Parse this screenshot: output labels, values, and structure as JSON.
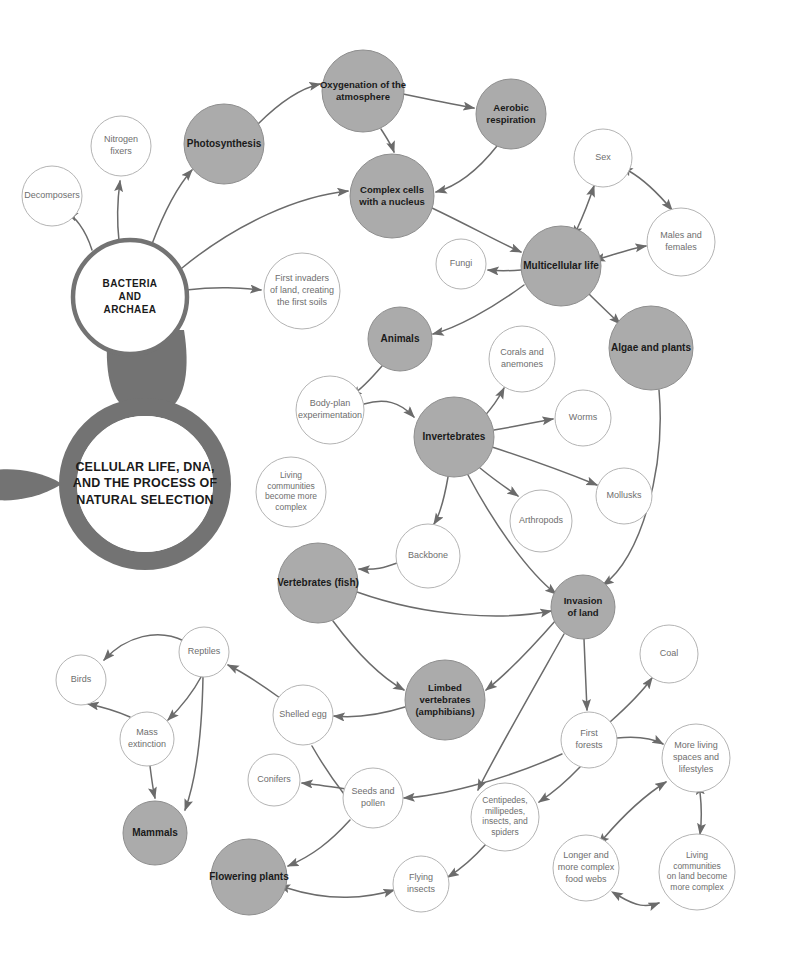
{
  "diagram": {
    "title_lines": [
      "CELLULAR LIFE, DNA,",
      "AND THE PROCESS OF",
      "NATURAL SELECTION"
    ],
    "root_label": "BACTERIA AND ARCHAEA",
    "root_lines": [
      "BACTERIA",
      "AND",
      "ARCHAEA"
    ],
    "colors": {
      "major_fill": "#ababab",
      "major_stroke": "#8e8e8e",
      "minor_fill": "#ffffff",
      "minor_stroke": "#b4b4b4",
      "arrow": "#6b6b6b",
      "magnifier": "#737373",
      "major_text": "#1a1a1a",
      "minor_text": "#6e6e6e",
      "background": "#ffffff"
    },
    "nodes": [
      {
        "id": "decomposers",
        "label": "Decomposers",
        "lines": [
          "Decomposers"
        ],
        "x": 52,
        "y": 196,
        "r": 30,
        "type": "minor",
        "fs": 9
      },
      {
        "id": "nitrogen-fixers",
        "label": "Nitrogen fixers",
        "lines": [
          "Nitrogen",
          "fixers"
        ],
        "x": 121,
        "y": 146,
        "r": 30,
        "type": "minor",
        "fs": 9
      },
      {
        "id": "photosynthesis",
        "label": "Photosynthesis",
        "lines": [
          "Photosynthesis"
        ],
        "x": 224,
        "y": 144,
        "r": 40,
        "type": "major",
        "fs": 10
      },
      {
        "id": "oxygenation",
        "label": "Oxygenation of the atmosphere",
        "lines": [
          "Oxygenation of the",
          "atmosphere"
        ],
        "x": 363,
        "y": 91,
        "r": 41,
        "type": "major",
        "fs": 9.5
      },
      {
        "id": "aerobic",
        "label": "Aerobic respiration",
        "lines": [
          "Aerobic",
          "respiration"
        ],
        "x": 511,
        "y": 114,
        "r": 35,
        "type": "major",
        "fs": 9.5
      },
      {
        "id": "complex-cells",
        "label": "Complex cells with a nucleus",
        "lines": [
          "Complex cells",
          "with a nucleus"
        ],
        "x": 392,
        "y": 196,
        "r": 42,
        "type": "major",
        "fs": 9.5
      },
      {
        "id": "sex",
        "label": "Sex",
        "lines": [
          "Sex"
        ],
        "x": 603,
        "y": 158,
        "r": 29,
        "type": "minor",
        "fs": 9
      },
      {
        "id": "males-females",
        "label": "Males and females",
        "lines": [
          "Males and",
          "females"
        ],
        "x": 681,
        "y": 242,
        "r": 34,
        "type": "minor",
        "fs": 9
      },
      {
        "id": "bacteria-archaea",
        "label": "BACTERIA AND ARCHAEA",
        "lines": [
          "BACTERIA",
          "AND",
          "ARCHAEA"
        ],
        "x": 130,
        "y": 297,
        "r": 57,
        "type": "root",
        "fs": 10
      },
      {
        "id": "first-invaders",
        "label": "First invaders of land, creating the first soils",
        "lines": [
          "First invaders",
          "of land, creating",
          "the first soils"
        ],
        "x": 302,
        "y": 291,
        "r": 38,
        "type": "minor",
        "fs": 9
      },
      {
        "id": "fungi",
        "label": "Fungi",
        "lines": [
          "Fungi"
        ],
        "x": 461,
        "y": 264,
        "r": 25,
        "type": "minor",
        "fs": 9
      },
      {
        "id": "multicellular",
        "label": "Multicellular life",
        "lines": [
          "Multicellular life"
        ],
        "x": 561,
        "y": 266,
        "r": 40,
        "type": "major",
        "fs": 10
      },
      {
        "id": "algae-plants",
        "label": "Algae and plants",
        "lines": [
          "Algae and plants"
        ],
        "x": 651,
        "y": 348,
        "r": 42,
        "type": "major",
        "fs": 10
      },
      {
        "id": "animals",
        "label": "Animals",
        "lines": [
          "Animals"
        ],
        "x": 400,
        "y": 339,
        "r": 32,
        "type": "major",
        "fs": 10
      },
      {
        "id": "corals-anemones",
        "label": "Corals and anemones",
        "lines": [
          "Corals and",
          "anemones"
        ],
        "x": 522,
        "y": 359,
        "r": 33,
        "type": "minor",
        "fs": 9
      },
      {
        "id": "body-plan",
        "label": "Body-plan experimentation",
        "lines": [
          "Body-plan",
          "experimentation"
        ],
        "x": 330,
        "y": 410,
        "r": 34,
        "type": "minor",
        "fs": 9
      },
      {
        "id": "invertebrates",
        "label": "Invertebrates",
        "lines": [
          "Invertebrates"
        ],
        "x": 454,
        "y": 437,
        "r": 40,
        "type": "major",
        "fs": 10
      },
      {
        "id": "worms",
        "label": "Worms",
        "lines": [
          "Worms"
        ],
        "x": 583,
        "y": 418,
        "r": 28,
        "type": "minor",
        "fs": 9
      },
      {
        "id": "mollusks",
        "label": "Mollusks",
        "lines": [
          "Mollusks"
        ],
        "x": 624,
        "y": 496,
        "r": 28,
        "type": "minor",
        "fs": 9
      },
      {
        "id": "arthropods",
        "label": "Arthropods",
        "lines": [
          "Arthropods"
        ],
        "x": 541,
        "y": 521,
        "r": 31,
        "type": "minor",
        "fs": 9
      },
      {
        "id": "living-complex",
        "label": "Living communities become more complex",
        "lines": [
          "Living",
          "communities",
          "become more",
          "complex"
        ],
        "x": 291,
        "y": 492,
        "r": 35,
        "type": "minor",
        "fs": 8.5
      },
      {
        "id": "backbone",
        "label": "Backbone",
        "lines": [
          "Backbone"
        ],
        "x": 428,
        "y": 556,
        "r": 32,
        "type": "minor",
        "fs": 9
      },
      {
        "id": "vertebrates-fish",
        "label": "Vertebrates (fish)",
        "lines": [
          "Vertebrates (fish)"
        ],
        "x": 318,
        "y": 583,
        "r": 40,
        "type": "major",
        "fs": 10
      },
      {
        "id": "invasion-of-land",
        "label": "Invasion of land",
        "lines": [
          "Invasion",
          "of land"
        ],
        "x": 583,
        "y": 607,
        "r": 32,
        "type": "major",
        "fs": 9.5
      },
      {
        "id": "coal",
        "label": "Coal",
        "lines": [
          "Coal"
        ],
        "x": 669,
        "y": 654,
        "r": 29,
        "type": "minor",
        "fs": 9
      },
      {
        "id": "reptiles",
        "label": "Reptiles",
        "lines": [
          "Reptiles"
        ],
        "x": 204,
        "y": 652,
        "r": 25,
        "type": "minor",
        "fs": 9
      },
      {
        "id": "birds",
        "label": "Birds",
        "lines": [
          "Birds"
        ],
        "x": 81,
        "y": 680,
        "r": 25,
        "type": "minor",
        "fs": 9
      },
      {
        "id": "limbed-vert",
        "label": "Limbed vertebrates (amphibians)",
        "lines": [
          "Limbed",
          "vertebrates",
          "(amphibians)"
        ],
        "x": 445,
        "y": 700,
        "r": 40,
        "type": "major",
        "fs": 9.5
      },
      {
        "id": "shelled-egg",
        "label": "Shelled egg",
        "lines": [
          "Shelled egg"
        ],
        "x": 303,
        "y": 715,
        "r": 30,
        "type": "minor",
        "fs": 9
      },
      {
        "id": "mass-extinction",
        "label": "Mass extinction",
        "lines": [
          "Mass",
          "extinction"
        ],
        "x": 147,
        "y": 739,
        "r": 27,
        "type": "minor",
        "fs": 9
      },
      {
        "id": "first-forests",
        "label": "First forests",
        "lines": [
          "First",
          "forests"
        ],
        "x": 589,
        "y": 740,
        "r": 28,
        "type": "minor",
        "fs": 9
      },
      {
        "id": "more-living-spaces",
        "label": "More living spaces and lifestyles",
        "lines": [
          "More living",
          "spaces and",
          "lifestyles"
        ],
        "x": 696,
        "y": 758,
        "r": 34,
        "type": "minor",
        "fs": 9
      },
      {
        "id": "conifers",
        "label": "Conifers",
        "lines": [
          "Conifers"
        ],
        "x": 274,
        "y": 780,
        "r": 26,
        "type": "minor",
        "fs": 9
      },
      {
        "id": "seeds-pollen",
        "label": "Seeds and pollen",
        "lines": [
          "Seeds and",
          "pollen"
        ],
        "x": 373,
        "y": 798,
        "r": 30,
        "type": "minor",
        "fs": 9
      },
      {
        "id": "centipedes",
        "label": "Centipedes, millipedes, insects, and spiders",
        "lines": [
          "Centipedes,",
          "millipedes,",
          "insects, and",
          "spiders"
        ],
        "x": 505,
        "y": 817,
        "r": 34,
        "type": "minor",
        "fs": 8.5
      },
      {
        "id": "mammals",
        "label": "Mammals",
        "lines": [
          "Mammals"
        ],
        "x": 155,
        "y": 833,
        "r": 32,
        "type": "major",
        "fs": 10
      },
      {
        "id": "longer-food-webs",
        "label": "Longer and more complex food webs",
        "lines": [
          "Longer and",
          "more complex",
          "food webs"
        ],
        "x": 586,
        "y": 868,
        "r": 33,
        "type": "minor",
        "fs": 9
      },
      {
        "id": "living-on-land",
        "label": "Living communities on land become more complex",
        "lines": [
          "Living",
          "communities",
          "on land become",
          "more complex"
        ],
        "x": 697,
        "y": 872,
        "r": 38,
        "type": "minor",
        "fs": 8.5
      },
      {
        "id": "flowering-plants",
        "label": "Flowering plants",
        "lines": [
          "Flowering plants"
        ],
        "x": 249,
        "y": 877,
        "r": 38,
        "type": "major",
        "fs": 10
      },
      {
        "id": "flying-insects",
        "label": "Flying insects",
        "lines": [
          "Flying",
          "insects"
        ],
        "x": 421,
        "y": 884,
        "r": 28,
        "type": "minor",
        "fs": 9
      }
    ],
    "edges": [
      {
        "from": "bacteria-archaea",
        "to": "decomposers",
        "path": "M 92 250 C 85 228 74 216 67 213",
        "heads": "end"
      },
      {
        "from": "bacteria-archaea",
        "to": "nitrogen-fixers",
        "path": "M 119 241 C 116 214 118 196 120 181",
        "heads": "end"
      },
      {
        "from": "bacteria-archaea",
        "to": "photosynthesis",
        "path": "M 152 244 C 164 212 176 188 192 170",
        "heads": "end"
      },
      {
        "from": "bacteria-archaea",
        "to": "complex-cells",
        "path": "M 182 268 C 238 222 300 196 348 191",
        "heads": "end"
      },
      {
        "from": "bacteria-archaea",
        "to": "first-invaders",
        "path": "M 186 290 C 220 286 240 288 261 290",
        "heads": "end"
      },
      {
        "from": "photosynthesis",
        "to": "oxygenation",
        "path": "M 258 124 C 282 100 302 88 320 84",
        "heads": "end"
      },
      {
        "from": "oxygenation",
        "to": "aerobic",
        "path": "M 403 94 C 432 100 452 104 474 108",
        "heads": "end"
      },
      {
        "from": "oxygenation",
        "to": "complex-cells",
        "path": "M 381 129 C 388 140 392 146 394 152",
        "heads": "end"
      },
      {
        "from": "aerobic",
        "to": "complex-cells",
        "path": "M 497 146 C 478 170 458 186 436 192",
        "heads": "end"
      },
      {
        "from": "complex-cells",
        "to": "multicellular",
        "path": "M 432 208 C 470 226 498 242 521 252",
        "heads": "end"
      },
      {
        "from": "multicellular",
        "to": "sex",
        "path": "M 577 229 C 585 212 590 198 594 186",
        "heads": "both"
      },
      {
        "from": "sex",
        "to": "males-females",
        "path": "M 629 171 C 648 182 662 198 672 210",
        "heads": "both"
      },
      {
        "from": "multicellular",
        "to": "males-females",
        "path": "M 602 258 C 622 252 634 248 646 246",
        "heads": "both"
      },
      {
        "from": "multicellular",
        "to": "fungi",
        "path": "M 521 270 C 508 271 498 271 488 270",
        "heads": "end"
      },
      {
        "from": "multicellular",
        "to": "algae-plants",
        "path": "M 589 294 C 603 308 612 316 620 324",
        "heads": "end"
      },
      {
        "from": "multicellular",
        "to": "animals",
        "path": "M 524 285 C 490 310 456 328 433 334",
        "heads": "end"
      },
      {
        "from": "animals",
        "to": "body-plan",
        "path": "M 382 366 C 370 380 360 390 351 396",
        "heads": "end"
      },
      {
        "from": "body-plan",
        "to": "invertebrates",
        "path": "M 364 404 C 385 398 400 402 414 417",
        "heads": "end"
      },
      {
        "from": "invertebrates",
        "to": "corals-anemones",
        "path": "M 482 419 C 492 408 499 398 504 388",
        "heads": "end"
      },
      {
        "from": "invertebrates",
        "to": "worms",
        "path": "M 494 430 C 518 426 535 422 553 419",
        "heads": "end"
      },
      {
        "from": "invertebrates",
        "to": "mollusks",
        "path": "M 492 447 C 532 460 570 474 597 485",
        "heads": "end"
      },
      {
        "from": "invertebrates",
        "to": "arthropods",
        "path": "M 480 468 C 497 482 508 489 518 496",
        "heads": "end"
      },
      {
        "from": "invertebrates",
        "to": "backbone",
        "path": "M 448 477 C 444 500 439 516 434 524",
        "heads": "end"
      },
      {
        "from": "invertebrates",
        "to": "invasion-of-land",
        "path": "M 468 475 C 494 524 528 572 556 594",
        "heads": "end"
      },
      {
        "from": "backbone",
        "to": "vertebrates-fish",
        "path": "M 397 563 C 384 568 376 570 359 569",
        "heads": "end"
      },
      {
        "from": "vertebrates-fish",
        "to": "invasion-of-land",
        "path": "M 357 592 C 430 618 505 620 551 611",
        "heads": "end"
      },
      {
        "from": "vertebrates-fish",
        "to": "limbed-vert",
        "path": "M 333 621 C 362 660 386 680 404 690",
        "heads": "end"
      },
      {
        "from": "algae-plants",
        "to": "invasion-of-land",
        "path": "M 659 390 C 666 470 640 560 603 585",
        "heads": "end"
      },
      {
        "from": "invasion-of-land",
        "to": "limbed-vert",
        "path": "M 556 620 C 528 652 504 676 486 690",
        "heads": "end"
      },
      {
        "from": "invasion-of-land",
        "to": "first-forests",
        "path": "M 584 639 C 585 660 586 690 587 710",
        "heads": "end"
      },
      {
        "from": "invasion-of-land",
        "to": "centipedes",
        "path": "M 564 634 C 520 712 488 768 478 790",
        "heads": "end"
      },
      {
        "from": "first-forests",
        "to": "coal",
        "path": "M 610 722 C 628 706 642 692 652 678",
        "heads": "end"
      },
      {
        "from": "first-forests",
        "to": "more-living-spaces",
        "path": "M 617 738 C 638 736 652 738 663 744",
        "heads": "end"
      },
      {
        "from": "first-forests",
        "to": "centipedes",
        "path": "M 580 767 C 562 786 548 796 539 802",
        "heads": "end"
      },
      {
        "from": "centipedes",
        "to": "flying-insects",
        "path": "M 486 844 C 470 862 456 872 448 877",
        "heads": "end"
      },
      {
        "from": "longer-food-webs",
        "to": "more-living-spaces",
        "path": "M 604 838 C 628 810 650 792 666 782",
        "heads": "both"
      },
      {
        "from": "more-living-spaces",
        "to": "living-on-land",
        "path": "M 700 792 C 702 810 702 820 700 834",
        "heads": "both"
      },
      {
        "from": "longer-food-webs",
        "to": "living-on-land",
        "path": "M 619 896 C 636 906 646 908 659 903",
        "heads": "both"
      },
      {
        "from": "limbed-vert",
        "to": "shelled-egg",
        "path": "M 405 707 C 376 716 354 718 334 716",
        "heads": "end"
      },
      {
        "from": "shelled-egg",
        "to": "reptiles",
        "path": "M 280 698 C 258 682 242 672 228 665",
        "heads": "end"
      },
      {
        "from": "reptiles",
        "to": "birds",
        "path": "M 184 641 C 158 628 126 636 104 660",
        "heads": "end"
      },
      {
        "from": "reptiles",
        "to": "mass-extinction",
        "path": "M 201 677 C 192 694 180 708 168 720",
        "heads": "end"
      },
      {
        "from": "reptiles",
        "to": "mammals",
        "path": "M 203 677 C 202 730 196 780 185 810",
        "heads": "end"
      },
      {
        "from": "mass-extinction",
        "to": "birds",
        "path": "M 130 717 C 114 710 98 706 88 704",
        "heads": "end"
      },
      {
        "from": "mass-extinction",
        "to": "mammals",
        "path": "M 150 766 C 152 782 153 790 155 798",
        "heads": "end"
      },
      {
        "from": "seeds-pollen",
        "to": "conifers",
        "path": "M 346 789 C 326 786 312 784 302 783",
        "heads": "end"
      },
      {
        "from": "seeds-pollen",
        "to": "flowering-plants",
        "path": "M 350 820 C 330 842 312 856 288 866",
        "heads": "end"
      },
      {
        "from": "seeds-pollen",
        "to": "shelled-egg",
        "path": "M 344 794 C 330 776 320 760 312 746",
        "heads": "none"
      },
      {
        "from": "flowering-plants",
        "to": "flying-insects",
        "path": "M 287 888 C 330 902 368 898 394 890",
        "heads": "both"
      },
      {
        "from": "first-forests",
        "to": "seeds-pollen",
        "path": "M 562 754 C 500 782 438 796 404 798",
        "heads": "end"
      }
    ],
    "magnifier": {
      "lens_cx": 145,
      "lens_cy": 484,
      "lens_outer_r": 86,
      "lens_inner_r": 68
    }
  }
}
